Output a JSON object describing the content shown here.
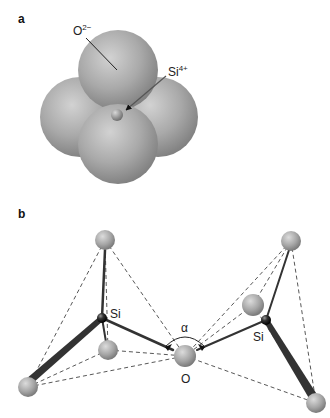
{
  "panel_a": {
    "label": "a",
    "oxygen_ion": "O",
    "oxygen_charge": "2−",
    "silicon_ion": "Si",
    "silicon_charge": "4+"
  },
  "panel_b": {
    "label": "b",
    "si_left": "Si",
    "si_right": "Si",
    "bridging_oxygen": "O",
    "angle": "α"
  },
  "colors": {
    "oxygen_sphere": "#a8a8a8",
    "silicon_sphere": "#222222",
    "bond": "#333333",
    "dashed_edge": "#444444"
  }
}
